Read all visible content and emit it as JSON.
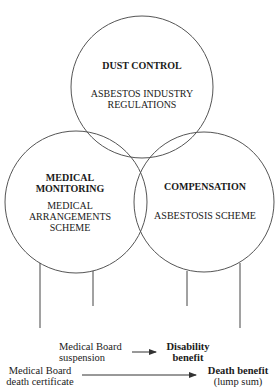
{
  "circles": {
    "dust_control": {
      "title": "DUST CONTROL",
      "subtitle_line1": "ASBESTOS INDUSTRY",
      "subtitle_line2": "REGULATIONS"
    },
    "medical_monitoring": {
      "title_line1": "MEDICAL",
      "title_line2": "MONITORING",
      "subtitle_line1": "MEDICAL",
      "subtitle_line2": "ARRANGEMENTS",
      "subtitle_line3": "SCHEME"
    },
    "compensation": {
      "title": "COMPENSATION",
      "subtitle": "ASBESTOSIS SCHEME"
    }
  },
  "outcomes": {
    "suspension": {
      "line1": "Medical Board",
      "line2": "suspension"
    },
    "disability": {
      "line1": "Disability",
      "line2": "benefit"
    },
    "death_certificate": {
      "line1": "Medical Board",
      "line2": "death certificate"
    },
    "death_benefit": {
      "line1": "Death benefit",
      "line2": "(lump sum)"
    }
  },
  "colors": {
    "line": "#444444",
    "text": "#1a1a1a",
    "background": "#ffffff"
  }
}
